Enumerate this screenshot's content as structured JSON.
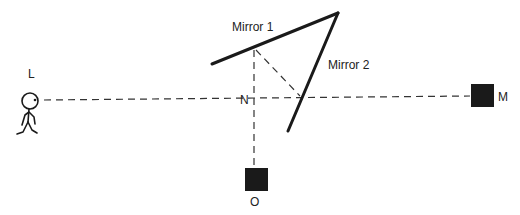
{
  "diagram": {
    "labels": {
      "mirror1": "Mirror 1",
      "mirror2": "Mirror 2",
      "observer": "L",
      "normal": "N",
      "object_right": "M",
      "object_bottom": "O"
    },
    "colors": {
      "ink": "#1a1a1a",
      "background": "#ffffff"
    }
  }
}
